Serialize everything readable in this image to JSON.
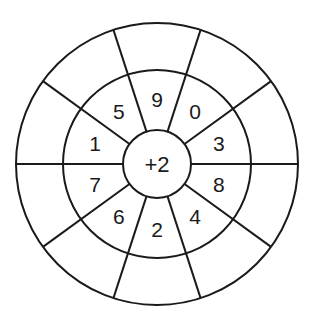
{
  "diagram": {
    "center_operation": "+2",
    "sector_count": 10,
    "inner_numbers_clockwise_from_top": [
      "9",
      "0",
      "3",
      "8",
      "4",
      "2",
      "6",
      "7",
      "1",
      "5"
    ],
    "outer_answers_clockwise_from_top": [
      "",
      "",
      "",
      "",
      "",
      "",
      "",
      "",
      "",
      ""
    ],
    "colors": {
      "line": "#1a1a1a",
      "background": "#ffffff"
    }
  }
}
